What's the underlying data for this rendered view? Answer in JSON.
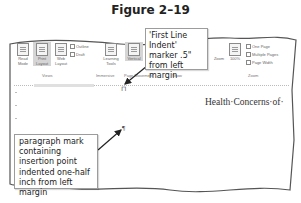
{
  "figure": {
    "title": "Figure 2–19"
  },
  "ribbon": {
    "views": {
      "buttons": [
        {
          "label": "Read Mode",
          "selected": false
        },
        {
          "label": "Print Layout",
          "selected": true
        },
        {
          "label": "Web Layout",
          "selected": false
        }
      ],
      "checks": [
        {
          "label": "Outline"
        },
        {
          "label": "Draft"
        }
      ],
      "group_label": "Views"
    },
    "immersive": {
      "buttons": [
        {
          "label": "Learning Tools"
        }
      ],
      "group_label": "Immersive"
    },
    "page_movement": {
      "buttons": [
        {
          "label": "Vertical",
          "selected": true
        },
        {
          "label": "Side to Side"
        }
      ],
      "group_label": "Page Movement"
    },
    "show": {
      "group_label": "Show"
    },
    "zoom": {
      "buttons": [
        {
          "label": "Zoom"
        },
        {
          "label": "100%"
        }
      ],
      "checks": [
        {
          "label": "One Page"
        },
        {
          "label": "Multiple Pages"
        },
        {
          "label": "Page Width"
        }
      ],
      "group_label": "Zoom"
    }
  },
  "ruler": {
    "marker_glyph": "⊓"
  },
  "document": {
    "heading_text": "Health·Concerns·of·",
    "paragraph_mark": "¶"
  },
  "callouts": {
    "top": "'First Line Indent' marker .5\" from left margin",
    "bottom": "paragraph mark containing insertion point indented one-half inch from left margin"
  },
  "colors": {
    "border": "#9c9c9c",
    "selected": "#d5d5d5",
    "arrow": "#222222"
  }
}
